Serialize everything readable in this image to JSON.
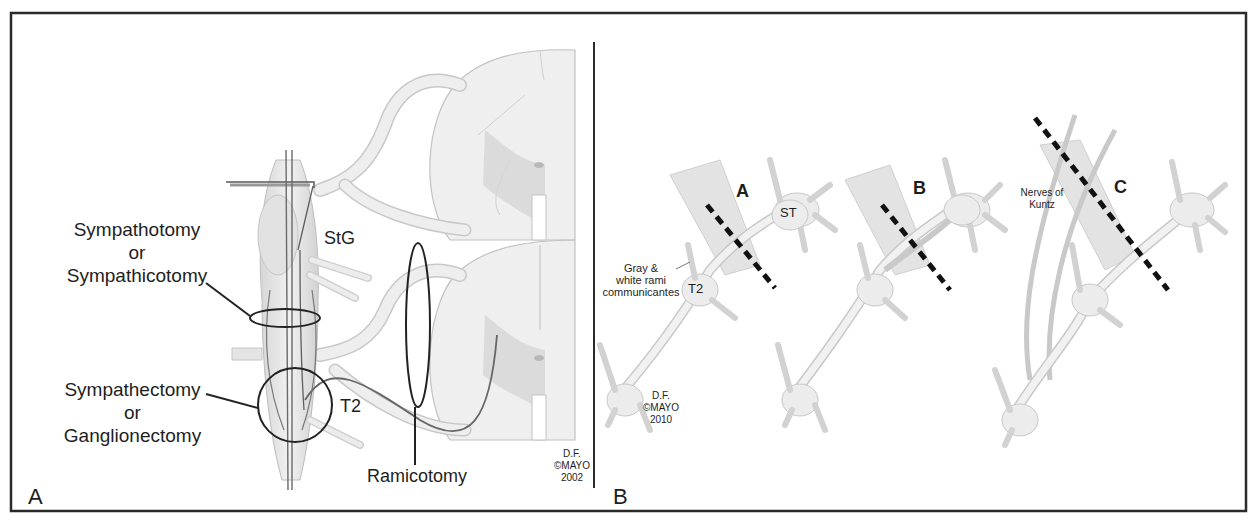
{
  "figure": {
    "panels": [
      {
        "id": "A",
        "letter": "A",
        "labels": {
          "sympathotomy": [
            "Sympathotomy",
            "or",
            "Sympathicotomy"
          ],
          "sympathectomy": [
            "Sympathectomy",
            "or",
            "Ganglionectomy"
          ],
          "stg": "StG",
          "t2": "T2",
          "ramicotomy": "Ramicotomy"
        },
        "credit": [
          "D.F.",
          "©MAYO",
          "2002"
        ]
      },
      {
        "id": "B",
        "letter": "B",
        "subpanels": [
          {
            "letter": "A",
            "labels": {
              "st": "ST",
              "t2": "T2",
              "rami": [
                "Gray &",
                "white rami",
                "communicantes"
              ]
            }
          },
          {
            "letter": "B"
          },
          {
            "letter": "C",
            "labels": {
              "kuntz": [
                "Nerves of",
                "Kuntz"
              ]
            }
          }
        ],
        "credit": [
          "D.F.",
          "©MAYO",
          "2010"
        ]
      }
    ],
    "colors": {
      "frame": "#2a2a2a",
      "nerve_fill": "#e6e6e6",
      "nerve_stroke": "#b5b5b5",
      "gray_matter": "#d0d0d0",
      "cut_line": "#111111",
      "annotation": "#222222"
    }
  }
}
